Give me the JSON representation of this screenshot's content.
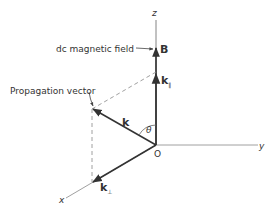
{
  "diagram": {
    "type": "3d-vector-diagram",
    "axes": {
      "x": {
        "label": "x"
      },
      "y": {
        "label": "y"
      },
      "z": {
        "label": "z"
      },
      "origin": {
        "label": "O"
      }
    },
    "vectors": {
      "B": {
        "label": "B",
        "annotation": "dc magnetic field"
      },
      "k": {
        "label": "k",
        "annotation": "Propagation vector"
      },
      "k_parallel": {
        "label": "k",
        "subscript": "∥"
      },
      "k_perp": {
        "label": "k",
        "subscript": "⊥"
      }
    },
    "angle": {
      "label": "θ"
    },
    "colors": {
      "line": "#333333",
      "thin_line": "#777777",
      "dashed": "#888888",
      "background": "#ffffff"
    }
  }
}
